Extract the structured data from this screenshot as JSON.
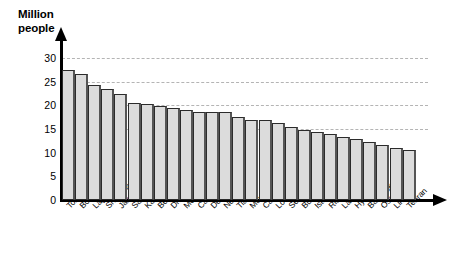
{
  "chart_data": {
    "type": "bar",
    "title": "Million people",
    "xlabel": "",
    "ylabel": "Million people",
    "ylim": [
      0,
      32
    ],
    "yticks": [
      0,
      5,
      10,
      15,
      20,
      25,
      30
    ],
    "grid": true,
    "legend": "none",
    "categories": [
      "Tokyo",
      "Bombay",
      "Lagos",
      "Shanghai",
      "Jakarta",
      "Sao Paolo",
      "Karachi",
      "Beijing",
      "Dhaka",
      "Mexico City",
      "Calcutta",
      "Delhi",
      "New York",
      "Tianjin",
      "Manila",
      "Cairo",
      "Los Angeles",
      "Seoul",
      "Buenos Aires",
      "Istanbul",
      "Rio de Janeiro",
      "Lahore",
      "Hyderabad",
      "Bangkok",
      "Osaka",
      "Lima",
      "Tehran"
    ],
    "values": [
      27.5,
      26.7,
      24.3,
      23.4,
      22.5,
      20.5,
      20.3,
      19.8,
      19.4,
      19.0,
      18.6,
      18.5,
      18.5,
      17.5,
      17.0,
      16.8,
      16.2,
      15.5,
      14.7,
      14.3,
      13.9,
      13.4,
      12.8,
      12.2,
      11.6,
      11.0,
      10.6
    ],
    "values_unit": "million people"
  },
  "axis": {
    "title_line1": "Million",
    "title_line2": "people",
    "title": "Million\npeople"
  }
}
